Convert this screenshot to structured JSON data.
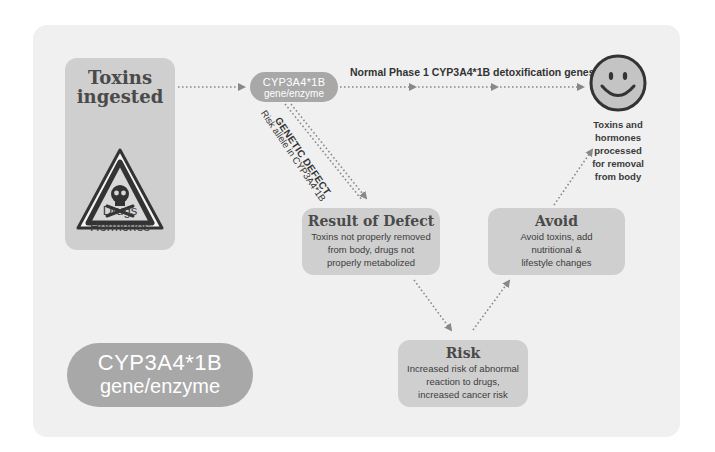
{
  "diagram": {
    "colors": {
      "panel_bg": "#f0f0f0",
      "box_fill": "#cfcfcf",
      "pill_fill": "#a8a8a8",
      "arrow": "#888888",
      "text": "#3a3a3a"
    },
    "toxins_box": {
      "title_line1": "Toxins",
      "title_line2": "ingested",
      "icon": "warning-skull-icon",
      "sub_line1": "Drugs",
      "sub_line2": "Hormones"
    },
    "gene_pill_small": {
      "line1": "CYP3A4*1B",
      "line2": "gene/enzyme"
    },
    "normal_path_label": "Normal Phase 1 CYP3A4*1B detoxification genes",
    "outcome": {
      "icon": "smiley-face-icon",
      "caption_lines": [
        "Toxins and",
        "hormones",
        "processed",
        "for removal",
        "from body"
      ]
    },
    "defect_path": {
      "label_bold": "GENETIC DEFECT",
      "label_risk_allele": "Risk allele in CYP3A4*1B"
    },
    "result_of_defect": {
      "title": "Result of Defect",
      "lines": [
        "Toxins not properly removed",
        "from body, drugs not",
        "properly metabolized"
      ]
    },
    "risk": {
      "title": "Risk",
      "lines": [
        "Increased risk of abnormal",
        "reaction to drugs,",
        "increased cancer risk"
      ]
    },
    "avoid": {
      "title": "Avoid",
      "lines": [
        "Avoid toxins, add",
        "nutritional &",
        "lifestyle changes"
      ]
    },
    "gene_pill_large": {
      "line1": "CYP3A4*1B",
      "line2": "gene/enzyme"
    }
  }
}
